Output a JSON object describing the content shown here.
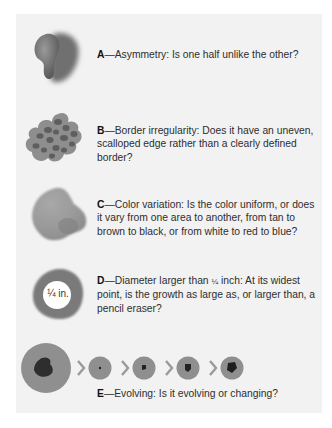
{
  "figure": {
    "items": [
      {
        "letter": "A",
        "dash": "—",
        "text": "Asymmetry: Is one half unlike the other?",
        "illustration": "asymmetric-mole"
      },
      {
        "letter": "B",
        "dash": "—",
        "text": "Border irregularity: Does it have an uneven, scalloped edge rather than a clearly defined border?",
        "illustration": "irregular-border-mole"
      },
      {
        "letter": "C",
        "dash": "—",
        "text": "Color variation: Is the color uniform, or does it vary from one area to another, from tan to brown to black, or from white to red to blue?",
        "illustration": "color-variation-mole"
      },
      {
        "letter": "D",
        "dash": "—",
        "text_before": "Diameter larger than ",
        "fraction": "¼",
        "text_after": " inch: At its widest point, is the growth as large as, or larger than, a pencil eraser?",
        "illustration": "diameter-mole",
        "illustration_label": "¼ in."
      },
      {
        "letter": "E",
        "dash": "—",
        "text": "Evolving: Is it evolving or changing?",
        "illustration": "evolving-mole-sequence",
        "sequence_arrow": "›"
      }
    ],
    "colors": {
      "panel_bg": "#f2f2f2",
      "mole_gray": "#8f8f8f",
      "mole_dark": "#3a3a3a"
    }
  }
}
